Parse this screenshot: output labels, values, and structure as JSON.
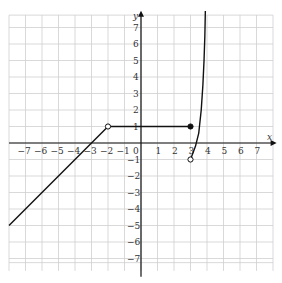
{
  "chart_data": {
    "type": "line",
    "title": "",
    "xlabel": "x",
    "ylabel": "y",
    "xlim": [
      -8,
      8
    ],
    "ylim": [
      -8,
      8
    ],
    "grid": true,
    "x_ticks": [
      -7,
      -6,
      -5,
      -4,
      -3,
      -2,
      -1,
      0,
      1,
      2,
      3,
      4,
      5,
      6,
      7
    ],
    "y_ticks": [
      -7,
      -6,
      -5,
      -4,
      -3,
      -2,
      -1,
      1,
      2,
      3,
      4,
      5,
      6,
      7
    ],
    "series": [
      {
        "name": "linear piece",
        "kind": "segment",
        "points": [
          [
            -8,
            -5
          ],
          [
            -2,
            1
          ]
        ],
        "end_open": true
      },
      {
        "name": "constant piece",
        "kind": "segment",
        "points": [
          [
            -2,
            1
          ],
          [
            3,
            1
          ]
        ],
        "start_open": true,
        "end_closed": true
      },
      {
        "name": "curve piece",
        "kind": "curve",
        "points": [
          [
            3,
            -1
          ],
          [
            3.3,
            -0.2
          ],
          [
            3.5,
            0.6
          ],
          [
            3.65,
            2
          ],
          [
            3.75,
            3.5
          ],
          [
            3.82,
            5
          ],
          [
            3.87,
            6.5
          ],
          [
            3.9,
            8
          ]
        ],
        "start_open": true,
        "asymptote_x": 4
      }
    ],
    "markers": [
      {
        "x": -2,
        "y": 1,
        "type": "open"
      },
      {
        "x": 3,
        "y": 1,
        "type": "closed"
      },
      {
        "x": 3,
        "y": -1,
        "type": "open"
      }
    ]
  },
  "labels": {
    "x_axis": "x",
    "y_axis": "y",
    "origin": "0"
  },
  "colors": {
    "grid": "#cfcfcf",
    "axis": "#111111",
    "curve": "#111111"
  }
}
